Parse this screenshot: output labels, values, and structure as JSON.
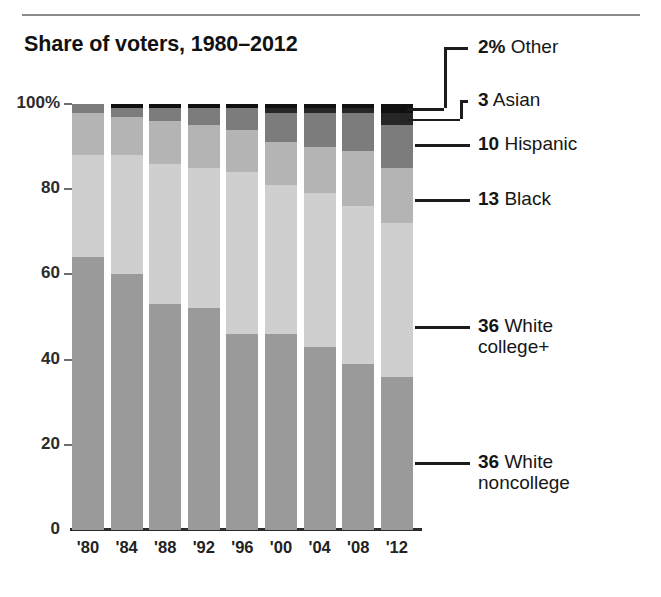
{
  "title": "Share of voters, 1980–2012",
  "yaxis": {
    "ticks": [
      "100%",
      "80",
      "60",
      "40",
      "20",
      "0"
    ],
    "values": [
      100,
      80,
      60,
      40,
      20,
      0
    ],
    "min": 0,
    "max": 100
  },
  "xaxis": {
    "ticks": [
      "'80",
      "'84",
      "'88",
      "'92",
      "'96",
      "'00",
      "'04",
      "'08",
      "'12"
    ]
  },
  "callouts": [
    {
      "num": "2%",
      "name": "Other"
    },
    {
      "num": "3",
      "name": "Asian"
    },
    {
      "num": "10",
      "name": "Hispanic"
    },
    {
      "num": "13",
      "name": "Black"
    },
    {
      "num": "36",
      "name": "White college+"
    },
    {
      "num": "36",
      "name": "White noncollege"
    }
  ],
  "colors": {
    "white_noncollege": "#9a9a9a",
    "white_college": "#cfcfcf",
    "black": "#b4b4b4",
    "hispanic": "#7c7c7c",
    "asian": "#262626",
    "other": "#101010",
    "axis": "#2b2b2b",
    "rule": "#8c8c8c"
  },
  "chart_data": {
    "type": "bar",
    "title": "Share of voters, 1980–2012",
    "xlabel": "",
    "ylabel": "",
    "ylim": [
      0,
      100
    ],
    "grid": false,
    "legend_position": "right-callouts",
    "stacked": true,
    "stack_order_bottom_to_top": [
      "White noncollege",
      "White college+",
      "Black",
      "Hispanic",
      "Asian",
      "Other"
    ],
    "categories": [
      "'80",
      "'84",
      "'88",
      "'92",
      "'96",
      "'00",
      "'04",
      "'08",
      "'12"
    ],
    "series": [
      {
        "name": "White noncollege",
        "color": "#9a9a9a",
        "values": [
          64,
          60,
          53,
          52,
          46,
          46,
          43,
          39,
          36
        ]
      },
      {
        "name": "White college+",
        "color": "#cfcfcf",
        "values": [
          24,
          28,
          33,
          33,
          38,
          35,
          36,
          37,
          36
        ]
      },
      {
        "name": "Black",
        "color": "#b4b4b4",
        "values": [
          10,
          9,
          10,
          10,
          10,
          10,
          11,
          13,
          13
        ]
      },
      {
        "name": "Hispanic",
        "color": "#7c7c7c",
        "values": [
          2,
          2,
          3,
          4,
          5,
          7,
          8,
          9,
          10
        ]
      },
      {
        "name": "Asian",
        "color": "#262626",
        "values": [
          0,
          0,
          0,
          0,
          0,
          1,
          1,
          1,
          3
        ]
      },
      {
        "name": "Other",
        "color": "#101010",
        "values": [
          0,
          1,
          1,
          1,
          1,
          1,
          1,
          1,
          2
        ]
      }
    ],
    "final_year_labels": {
      "Other": "2%",
      "Asian": "3",
      "Hispanic": "10",
      "Black": "13",
      "White college+": "36",
      "White noncollege": "36"
    }
  }
}
